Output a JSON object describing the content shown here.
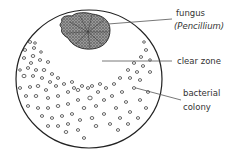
{
  "diagram": {
    "type": "petri-dish-illustration",
    "labels": {
      "fungus": "fungus",
      "fungus_species": "(Pencillium)",
      "clear_zone": "clear zone",
      "bacterial_line1": "bacterial",
      "bacterial_line2": "colony"
    },
    "colors": {
      "outline": "#222222",
      "fungus_fill": "#777777",
      "leader_line": "#555555",
      "colony_stroke": "#444444"
    }
  }
}
